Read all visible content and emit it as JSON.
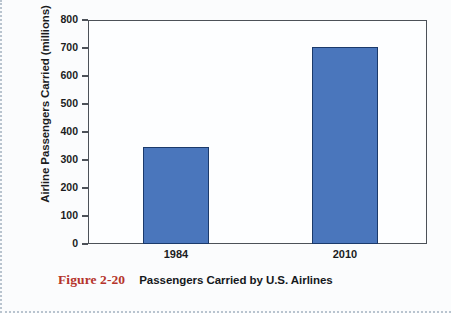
{
  "caption": {
    "figure_number": "Figure 2-20",
    "title": "Passengers Carried by U.S. Airlines"
  },
  "chart_data": {
    "type": "bar",
    "title": "Passengers Carried by U.S. Airlines",
    "categories": [
      "1984",
      "2010"
    ],
    "values": [
      345,
      705
    ],
    "xlabel": "",
    "ylabel": "Airline Passengers Carried (millions)",
    "ylim": [
      0,
      800
    ],
    "ytick_step": 100,
    "yticks": [
      "0",
      "100",
      "200",
      "300",
      "400",
      "500",
      "600",
      "700",
      "800"
    ],
    "grid": false,
    "legend": false,
    "series": [
      {
        "name": "Airline Passengers Carried (millions)",
        "values": [
          345,
          705
        ]
      }
    ],
    "colors": {
      "bar_fill": "#4a76bc",
      "bar_border": "#1b3a6b",
      "axis": "#4c5158",
      "text": "#1b1c1e",
      "figure_number": "#b5342b",
      "plot_background": "#fdfeff",
      "page_background": "#fbfcfd"
    }
  }
}
